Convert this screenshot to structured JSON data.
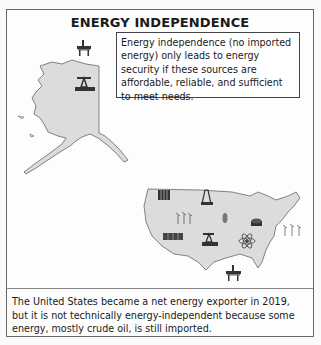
{
  "title": "ENERGY INDEPENDENCE",
  "callout": {
    "text": "Energy independence (no imported energy) only leads to energy security if these sources are affordable, reliable, and sufficient to meet needs."
  },
  "footer": {
    "text": "The United States became a net energy exporter in 2019, but it is not technically energy-independent because some energy, mostly crude oil, is still imported."
  },
  "maps": {
    "alaska": {
      "label": "Alaska",
      "icons": [
        "offshore-oil-rig-icon",
        "oil-pumpjack-icon"
      ]
    },
    "contiguous_us": {
      "label": "Contiguous United States",
      "icons": [
        "solar-panel-icon",
        "oil-derrick-icon",
        "wind-turbine-icon",
        "corn-biofuel-icon",
        "coal-cart-icon",
        "solar-panel-icon",
        "oil-pumpjack-icon",
        "nuclear-atom-icon",
        "offshore-wind-turbine-icon",
        "offshore-oil-rig-icon"
      ]
    }
  },
  "colors": {
    "land": "#dcdcdc",
    "outline": "#666666",
    "border": "#666666",
    "text": "#1a1a1a"
  }
}
